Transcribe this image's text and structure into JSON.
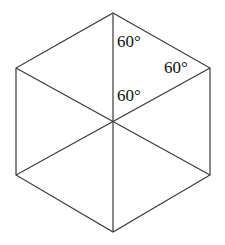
{
  "figure": {
    "type": "hexagon-with-center-diagonals",
    "background_color": "#ffffff",
    "stroke_color": "#3a3a3a",
    "stroke_width": 1.2,
    "canvas": {
      "width": 225,
      "height": 245
    },
    "vertices": [
      {
        "name": "top",
        "x": 113,
        "y": 13
      },
      {
        "name": "upper-right",
        "x": 210,
        "y": 68
      },
      {
        "name": "lower-right",
        "x": 210,
        "y": 175
      },
      {
        "name": "bottom",
        "x": 113,
        "y": 232
      },
      {
        "name": "lower-left",
        "x": 16,
        "y": 175
      },
      {
        "name": "upper-left",
        "x": 16,
        "y": 68
      }
    ],
    "center": {
      "x": 113,
      "y": 122
    },
    "diagonals": [
      {
        "from": "top",
        "to": "bottom"
      },
      {
        "from": "upper-left",
        "to": "lower-right"
      },
      {
        "from": "upper-right",
        "to": "lower-left"
      }
    ],
    "labels": [
      {
        "id": "top",
        "text": "60°",
        "x": 117,
        "y": 33
      },
      {
        "id": "right",
        "text": "60°",
        "x": 164,
        "y": 59
      },
      {
        "id": "center",
        "text": "60°",
        "x": 117,
        "y": 87
      }
    ]
  }
}
